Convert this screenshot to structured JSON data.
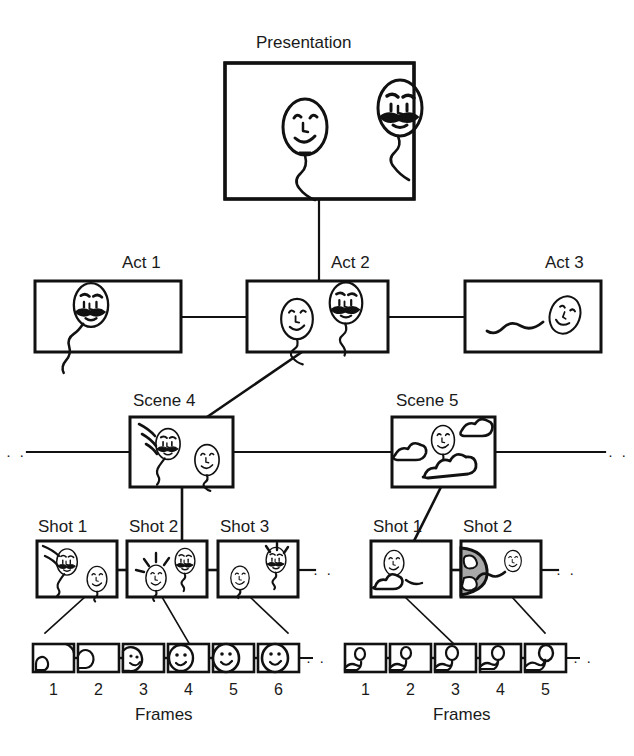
{
  "figure": {
    "title_label": "Presentation",
    "caption_hidden": "",
    "background_color": "#ffffff",
    "ink_color": "#111111",
    "shading_color": "#a8a8a8"
  },
  "levels": {
    "presentation": {
      "label": "Presentation",
      "box": {
        "x": 225,
        "y": 63,
        "w": 189,
        "h": 136
      },
      "content_description": "two balloon-head characters, one smiling and one with a moustache frowning"
    },
    "acts": {
      "items": [
        {
          "label": "Act 1",
          "box": {
            "x": 35,
            "y": 281,
            "w": 146,
            "h": 71
          },
          "content_description": "moustached angry balloon head with wavy string"
        },
        {
          "label": "Act 2",
          "box": {
            "x": 247,
            "y": 281,
            "w": 141,
            "h": 71
          },
          "content_description": "smiling balloon head and moustached angry balloon head"
        },
        {
          "label": "Act 3",
          "box": {
            "x": 465,
            "y": 281,
            "w": 136,
            "h": 71
          },
          "content_description": "small balloon head with long wavy string"
        }
      ]
    },
    "scenes": {
      "items": [
        {
          "label": "Scene 4",
          "box": {
            "x": 130,
            "y": 417,
            "w": 103,
            "h": 70
          },
          "content_description": "moustached balloon head with motion lines and a second balloon head"
        },
        {
          "label": "Scene 5",
          "box": {
            "x": 392,
            "y": 417,
            "w": 103,
            "h": 70
          },
          "content_description": "balloon head floating among clouds"
        }
      ],
      "leader_dots_left": "· ·",
      "leader_dots_right": "· ·"
    },
    "shot_groups": [
      {
        "parent": "Scene 4",
        "items": [
          {
            "label": "Shot 1",
            "box": {
              "x": 37,
              "y": 541,
              "w": 80,
              "h": 56
            },
            "content_description": "moustached balloon head upper-left, second balloon head lower-right"
          },
          {
            "label": "Shot 2",
            "box": {
              "x": 127,
              "y": 541,
              "w": 80,
              "h": 56
            },
            "content_description": "smiling balloon head with radiating lines and moustached balloon head"
          },
          {
            "label": "Shot 3",
            "box": {
              "x": 218,
              "y": 541,
              "w": 80,
              "h": 56
            },
            "content_description": "small balloon head left, moustached balloon head with rays right"
          }
        ],
        "trailing_dots": "· ·"
      },
      {
        "parent": "Scene 5",
        "items": [
          {
            "label": "Shot 1",
            "box": {
              "x": 371,
              "y": 541,
              "w": 80,
              "h": 56
            },
            "content_description": "balloon head with clouds"
          },
          {
            "label": "Shot 2",
            "box": {
              "x": 461,
              "y": 541,
              "w": 80,
              "h": 56
            },
            "content_description": "shaded grey sphere at left and balloon head at right"
          }
        ],
        "trailing_dots": "· ·"
      }
    ],
    "frame_groups": [
      {
        "caption": "Frames",
        "caption_x": 167,
        "frames": [
          {
            "number": "1",
            "box": {
              "x": 33,
              "y": 644,
              "w": 41,
              "h": 28
            }
          },
          {
            "number": "2",
            "box": {
              "x": 78,
              "y": 644,
              "w": 41,
              "h": 28
            }
          },
          {
            "number": "3",
            "box": {
              "x": 123,
              "y": 644,
              "w": 41,
              "h": 28
            }
          },
          {
            "number": "4",
            "box": {
              "x": 168,
              "y": 644,
              "w": 41,
              "h": 28
            }
          },
          {
            "number": "5",
            "box": {
              "x": 213,
              "y": 644,
              "w": 41,
              "h": 28
            }
          },
          {
            "number": "6",
            "box": {
              "x": 258,
              "y": 644,
              "w": 41,
              "h": 28
            }
          }
        ],
        "trailing_dots": "· ·"
      },
      {
        "caption": "Frames",
        "caption_x": 468,
        "frames": [
          {
            "number": "1",
            "box": {
              "x": 345,
              "y": 644,
              "w": 41,
              "h": 28
            }
          },
          {
            "number": "2",
            "box": {
              "x": 390,
              "y": 644,
              "w": 41,
              "h": 28
            }
          },
          {
            "number": "3",
            "box": {
              "x": 435,
              "y": 644,
              "w": 41,
              "h": 28
            }
          },
          {
            "number": "4",
            "box": {
              "x": 480,
              "y": 644,
              "w": 41,
              "h": 28
            }
          },
          {
            "number": "5",
            "box": {
              "x": 525,
              "y": 644,
              "w": 41,
              "h": 28
            }
          }
        ],
        "trailing_dots": "· ·"
      }
    ]
  },
  "labels": {
    "presentation": "Presentation",
    "act_1": "Act 1",
    "act_2": "Act 2",
    "act_3": "Act 3",
    "scene_4": "Scene 4",
    "scene_5": "Scene 5",
    "left_shot_1": "Shot 1",
    "left_shot_2": "Shot 2",
    "left_shot_3": "Shot 3",
    "right_shot_1": "Shot 1",
    "right_shot_2": "Shot 2",
    "frames_left": "Frames",
    "frames_right": "Frames",
    "num_1": "1",
    "num_2": "2",
    "num_3": "3",
    "num_4": "4",
    "num_5": "5",
    "num_6": "6",
    "ellipsis": "· ·"
  }
}
